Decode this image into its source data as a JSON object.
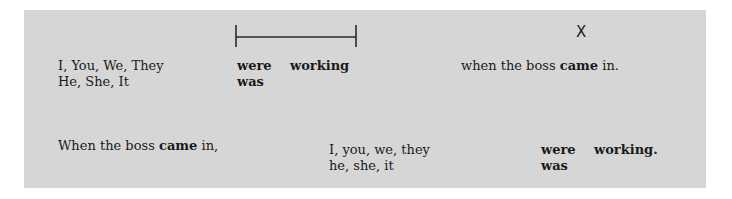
{
  "timeline": {
    "duration_bracket": "interval",
    "point_marker": "X"
  },
  "row1": {
    "subjects_plural": "I, You, We, They",
    "subjects_singular": "He, She, It",
    "aux_plural": "were",
    "verb": "working",
    "aux_singular": "was",
    "clause_pre": "when the boss ",
    "clause_verb": "came",
    "clause_post": " in."
  },
  "row2": {
    "clause_pre": "When the boss ",
    "clause_verb": "came",
    "clause_post": " in,",
    "subjects_plural": "I, you, we, they",
    "subjects_singular": "he, she, it",
    "aux_plural": "were",
    "verb": "working.",
    "aux_singular": "was"
  }
}
